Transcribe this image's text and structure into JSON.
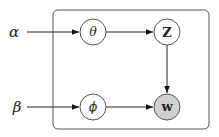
{
  "diagram": {
    "type": "plate-notation graphical model",
    "hyperparameters": [
      {
        "id": "alpha",
        "label": "α"
      },
      {
        "id": "beta",
        "label": "β"
      }
    ],
    "nodes": [
      {
        "id": "theta",
        "label": "θ",
        "observed": false
      },
      {
        "id": "z",
        "label": "Z",
        "observed": false
      },
      {
        "id": "phi",
        "label": "ϕ",
        "observed": false
      },
      {
        "id": "w",
        "label": "w",
        "observed": true
      }
    ],
    "edges": [
      {
        "from": "alpha",
        "to": "theta"
      },
      {
        "from": "theta",
        "to": "z"
      },
      {
        "from": "z",
        "to": "w"
      },
      {
        "from": "beta",
        "to": "phi"
      },
      {
        "from": "phi",
        "to": "w"
      }
    ],
    "colors": {
      "stroke": "#444444",
      "observed_fill": "#d0d0d0",
      "latent_fill": "#ffffff"
    }
  }
}
